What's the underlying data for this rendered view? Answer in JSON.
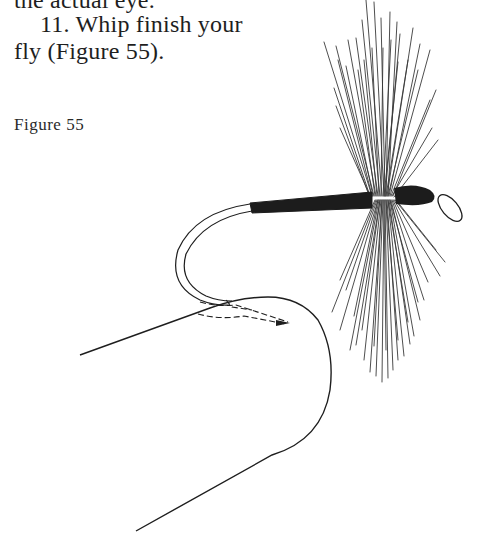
{
  "document": {
    "previous_line_fragment": "the actual eye.",
    "step": {
      "number": "11.",
      "line1": "11. Whip finish your",
      "line2": "fly (Figure 55)."
    },
    "figure": {
      "caption": "Figure 55",
      "description": "Illustration of a whip finish: thread wrapped around the hook shank behind the eye of a dry fly with hackle, with a looped line forming the whip-finish knot.",
      "parts": [
        "hook-eye",
        "thread-body",
        "hackle",
        "hook-bend",
        "whip-finish-loop",
        "dashed-knot-path"
      ]
    },
    "colors": {
      "ink": "#1e1e1e",
      "paper": "#ffffff"
    }
  }
}
